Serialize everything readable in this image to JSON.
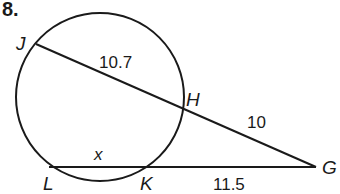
{
  "problem": {
    "number": "8."
  },
  "figure": {
    "stroke_color": "#1a1a1a",
    "circle": {
      "cx": 100,
      "cy": 97,
      "r": 84
    },
    "points": {
      "J": {
        "label": "J",
        "x": 36,
        "y": 44
      },
      "H": {
        "label": "H",
        "x": 181,
        "y": 111
      },
      "G": {
        "label": "G",
        "x": 316,
        "y": 167
      },
      "K": {
        "label": "K",
        "x": 147,
        "y": 167
      },
      "L": {
        "label": "L",
        "x": 49,
        "y": 167
      }
    },
    "segments": [
      {
        "name": "secant-JG",
        "from": "J",
        "to": "G"
      },
      {
        "name": "secant-LG",
        "from": "L",
        "to": "G"
      }
    ],
    "measures": {
      "JH": "10.7",
      "HG": "10",
      "LK": "x",
      "KG": "11.5"
    }
  }
}
